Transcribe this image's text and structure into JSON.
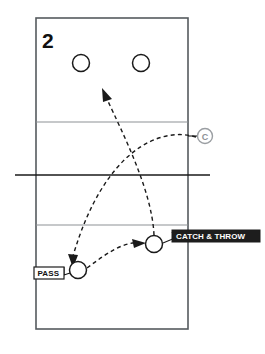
{
  "diagram": {
    "number_label": "2",
    "type": "volleyball-drill-court-diagram",
    "background_color": "#ffffff",
    "court": {
      "outline_color": "#555a5e",
      "attack_line_color": "#8d9195",
      "net_line_color": "#1a1a1a",
      "x": 36,
      "y": 18,
      "width": 152,
      "height": 311,
      "attack_lines_y": [
        122,
        225
      ],
      "net_line": {
        "y": 175,
        "x1": 15,
        "x2": 210
      }
    },
    "players": [
      {
        "name": "player-back-left",
        "cx": 81,
        "cy": 63,
        "r": 8.5,
        "label": ""
      },
      {
        "name": "player-back-right",
        "cx": 141,
        "cy": 63,
        "r": 8.5,
        "label": ""
      },
      {
        "name": "player-passer",
        "cx": 78,
        "cy": 270,
        "r": 8.5,
        "label": "PASS"
      },
      {
        "name": "player-catcher",
        "cx": 154,
        "cy": 244,
        "r": 8.5,
        "label": "CATCH & THROW"
      }
    ],
    "coach": {
      "name": "coach-marker",
      "letter": "C",
      "cx": 205,
      "cy": 136,
      "r": 7.5,
      "color": "#8e9296",
      "tick_x1": 188,
      "tick_x2": 197
    },
    "labels": [
      {
        "name": "catch-and-throw-label",
        "text": "CATCH & THROW",
        "style": "dark",
        "box_x": 172,
        "box_y": 230,
        "box_w": 88,
        "box_h": 12,
        "text_x": 176,
        "text_y": 236
      },
      {
        "name": "pass-label",
        "text": "PASS",
        "style": "light",
        "box_x": 34,
        "box_y": 267,
        "box_w": 30,
        "box_h": 12,
        "text_x": 38,
        "text_y": 273
      }
    ],
    "motion_paths": [
      {
        "name": "coach-toss-to-passer-path",
        "description": "dashed arc from coach to passing player",
        "d": "M 196 137 C 160 126 104 150 73 256",
        "arrow": {
          "x": 71,
          "y": 263,
          "angle": 105
        }
      },
      {
        "name": "pass-to-catcher-path",
        "description": "dashed arc from passer to catch-and-throw player",
        "d": "M 87 268 C 108 252 126 240 146 243",
        "arrow": {
          "x": 146,
          "y": 242,
          "angle": 12
        }
      },
      {
        "name": "throw-up-court-path",
        "description": "dashed arc from catch-and-throw player toward back court",
        "d": "M 154 235 C 152 190 122 132 105 96",
        "arrow": {
          "x": 103,
          "y": 92,
          "angle": -118
        }
      }
    ]
  }
}
